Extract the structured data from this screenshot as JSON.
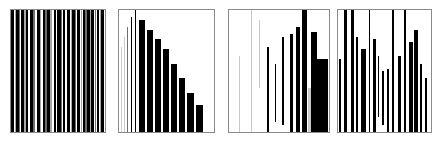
{
  "figure": {
    "title": "",
    "background_color": "#ffffff",
    "panel_border_color": "#8a8a8a",
    "bar_color": "#000000",
    "gray_bar_color": "#a8a8a8",
    "caption_text": "",
    "panel_count": 4
  },
  "chart_data": [
    {
      "type": "bar",
      "title": "Panel 1",
      "subtitle": "",
      "xlabel": "",
      "ylabel": "",
      "grid": false,
      "legend": "none",
      "orientation": "vertical",
      "description": "Dense full-height vertical bar code pattern spanning the full panel height",
      "xlim": [
        0,
        100
      ],
      "ylim": [
        0,
        100
      ],
      "categories": [
        "b1",
        "b2",
        "b3",
        "b4",
        "b5",
        "b6",
        "b7",
        "b8",
        "b9",
        "b10",
        "b11",
        "b12",
        "b13",
        "b14",
        "b15",
        "b16",
        "b17",
        "b18",
        "b19",
        "b20",
        "b21",
        "b22",
        "b23",
        "b24",
        "b25",
        "b26",
        "b27",
        "b28",
        "b29",
        "b30",
        "b31",
        "b32",
        "b33",
        "b34"
      ],
      "values": [
        100,
        100,
        100,
        100,
        100,
        100,
        100,
        100,
        100,
        100,
        100,
        100,
        100,
        100,
        100,
        100,
        100,
        100,
        100,
        100,
        100,
        100,
        100,
        100,
        100,
        100,
        100,
        100,
        100,
        100,
        100,
        100,
        100,
        100
      ],
      "bars": [
        {
          "x": 0.5,
          "w": 3.0,
          "y0": 0,
          "y1": 100,
          "shade": "black"
        },
        {
          "x": 4.0,
          "w": 1.5,
          "y0": 0,
          "y1": 100,
          "shade": "gray"
        },
        {
          "x": 5.8,
          "w": 2.6,
          "y0": 0,
          "y1": 100,
          "shade": "black"
        },
        {
          "x": 8.8,
          "w": 1.2,
          "y0": 0,
          "y1": 100,
          "shade": "midgray"
        },
        {
          "x": 10.4,
          "w": 3.4,
          "y0": 0,
          "y1": 100,
          "shade": "black"
        },
        {
          "x": 14.2,
          "w": 1.6,
          "y0": 0,
          "y1": 100,
          "shade": "gray"
        },
        {
          "x": 16.2,
          "w": 2.2,
          "y0": 0,
          "y1": 100,
          "shade": "black"
        },
        {
          "x": 20.6,
          "w": 2.8,
          "y0": 0,
          "y1": 100,
          "shade": "black"
        },
        {
          "x": 23.8,
          "w": 1.4,
          "y0": 0,
          "y1": 100,
          "shade": "midgray"
        },
        {
          "x": 27.4,
          "w": 3.2,
          "y0": 0,
          "y1": 100,
          "shade": "black"
        },
        {
          "x": 31.0,
          "w": 1.0,
          "y0": 0,
          "y1": 100,
          "shade": "gray"
        },
        {
          "x": 33.6,
          "w": 2.4,
          "y0": 0,
          "y1": 100,
          "shade": "black"
        },
        {
          "x": 36.4,
          "w": 1.8,
          "y0": 0,
          "y1": 100,
          "shade": "midgray"
        },
        {
          "x": 38.6,
          "w": 3.0,
          "y0": 0,
          "y1": 100,
          "shade": "black"
        },
        {
          "x": 42.0,
          "w": 1.2,
          "y0": 0,
          "y1": 100,
          "shade": "gray"
        },
        {
          "x": 45.4,
          "w": 2.0,
          "y0": 0,
          "y1": 100,
          "shade": "black"
        },
        {
          "x": 49.2,
          "w": 3.6,
          "y0": 0,
          "y1": 100,
          "shade": "black"
        },
        {
          "x": 53.2,
          "w": 1.4,
          "y0": 0,
          "y1": 100,
          "shade": "midgray"
        },
        {
          "x": 55.0,
          "w": 2.6,
          "y0": 0,
          "y1": 100,
          "shade": "black"
        },
        {
          "x": 59.6,
          "w": 3.4,
          "y0": 0,
          "y1": 100,
          "shade": "black"
        },
        {
          "x": 63.4,
          "w": 1.6,
          "y0": 0,
          "y1": 100,
          "shade": "gray"
        },
        {
          "x": 65.4,
          "w": 2.2,
          "y0": 0,
          "y1": 100,
          "shade": "black"
        },
        {
          "x": 68.0,
          "w": 1.2,
          "y0": 0,
          "y1": 100,
          "shade": "midgray"
        },
        {
          "x": 70.6,
          "w": 3.0,
          "y0": 0,
          "y1": 100,
          "shade": "black"
        },
        {
          "x": 74.0,
          "w": 1.8,
          "y0": 0,
          "y1": 100,
          "shade": "gray"
        },
        {
          "x": 76.2,
          "w": 2.4,
          "y0": 0,
          "y1": 100,
          "shade": "black"
        },
        {
          "x": 79.0,
          "w": 1.4,
          "y0": 0,
          "y1": 100,
          "shade": "midgray"
        },
        {
          "x": 80.8,
          "w": 2.8,
          "y0": 0,
          "y1": 100,
          "shade": "black"
        },
        {
          "x": 84.0,
          "w": 1.2,
          "y0": 0,
          "y1": 100,
          "shade": "gray"
        },
        {
          "x": 85.6,
          "w": 3.2,
          "y0": 0,
          "y1": 100,
          "shade": "black"
        },
        {
          "x": 89.2,
          "w": 1.6,
          "y0": 0,
          "y1": 100,
          "shade": "midgray"
        },
        {
          "x": 91.2,
          "w": 2.6,
          "y0": 0,
          "y1": 100,
          "shade": "black"
        },
        {
          "x": 94.2,
          "w": 1.4,
          "y0": 0,
          "y1": 100,
          "shade": "gray"
        },
        {
          "x": 96.0,
          "w": 3.4,
          "y0": 0,
          "y1": 100,
          "shade": "black"
        }
      ]
    },
    {
      "type": "bar",
      "title": "Panel 2",
      "subtitle": "",
      "xlabel": "",
      "ylabel": "",
      "grid": false,
      "legend": "none",
      "orientation": "vertical",
      "description": "Monotonically decreasing staircase of bars; leftmost bars are thin light-gray and tall, right bars are thick black and short",
      "xlim": [
        0,
        100
      ],
      "ylim": [
        0,
        100
      ],
      "categories": [
        "1",
        "2",
        "3",
        "4",
        "5",
        "6",
        "7",
        "8",
        "9",
        "10",
        "11",
        "12",
        "13"
      ],
      "values": [
        98,
        92,
        84,
        72,
        96,
        86,
        76,
        66,
        56,
        46,
        36,
        26,
        18
      ],
      "bars": [
        {
          "x": 2.0,
          "w": 0.9,
          "y0": 0,
          "y1": 70,
          "shade": "lightgray"
        },
        {
          "x": 5.0,
          "w": 0.9,
          "y0": 0,
          "y1": 78,
          "shade": "lightgray"
        },
        {
          "x": 8.5,
          "w": 1.1,
          "y0": 0,
          "y1": 86,
          "shade": "midgray"
        },
        {
          "x": 12.5,
          "w": 1.4,
          "y0": 0,
          "y1": 94,
          "shade": "black"
        },
        {
          "x": 16.5,
          "w": 1.6,
          "y0": 0,
          "y1": 100,
          "shade": "black"
        },
        {
          "x": 21.0,
          "w": 6.5,
          "y0": 0,
          "y1": 92,
          "shade": "black"
        },
        {
          "x": 29.5,
          "w": 6.5,
          "y0": 0,
          "y1": 84,
          "shade": "black"
        },
        {
          "x": 38.0,
          "w": 6.5,
          "y0": 0,
          "y1": 76,
          "shade": "black"
        },
        {
          "x": 46.5,
          "w": 6.5,
          "y0": 0,
          "y1": 68,
          "shade": "black"
        },
        {
          "x": 55.0,
          "w": 6.5,
          "y0": 0,
          "y1": 56,
          "shade": "black"
        },
        {
          "x": 63.5,
          "w": 6.5,
          "y0": 0,
          "y1": 44,
          "shade": "black"
        },
        {
          "x": 72.0,
          "w": 6.5,
          "y0": 0,
          "y1": 32,
          "shade": "black"
        },
        {
          "x": 81.0,
          "w": 7.0,
          "y0": 0,
          "y1": 22,
          "shade": "black"
        }
      ]
    },
    {
      "type": "bar",
      "title": "Panel 3",
      "subtitle": "",
      "xlabel": "",
      "ylabel": "",
      "grid": false,
      "legend": "none",
      "orientation": "vertical",
      "description": "Floating bars increasing in weight and width left to right; thin light-gray tall lines on the left, thick black bars on the right",
      "xlim": [
        0,
        100
      ],
      "ylim": [
        0,
        100
      ],
      "categories": [
        "1",
        "2",
        "3",
        "4",
        "5",
        "6",
        "7",
        "8",
        "9",
        "10",
        "11"
      ],
      "values": [
        62,
        100,
        56,
        100,
        70,
        48,
        66,
        80,
        100,
        82,
        60
      ],
      "bars": [
        {
          "x": 10.0,
          "w": 0.8,
          "y0": 0,
          "y1": 62,
          "shade": "lightgray"
        },
        {
          "x": 21.5,
          "w": 0.9,
          "y0": 0,
          "y1": 100,
          "shade": "lightgray"
        },
        {
          "x": 30.0,
          "w": 0.9,
          "y0": 36,
          "y1": 92,
          "shade": "lightgray"
        },
        {
          "x": 38.0,
          "w": 1.6,
          "y0": 0,
          "y1": 70,
          "shade": "black"
        },
        {
          "x": 45.5,
          "w": 1.8,
          "y0": 8,
          "y1": 56,
          "shade": "black"
        },
        {
          "x": 53.0,
          "w": 2.4,
          "y0": 6,
          "y1": 78,
          "shade": "black"
        },
        {
          "x": 60.5,
          "w": 3.0,
          "y0": 0,
          "y1": 80,
          "shade": "black"
        },
        {
          "x": 66.5,
          "w": 4.0,
          "y0": 0,
          "y1": 86,
          "shade": "black"
        },
        {
          "x": 72.5,
          "w": 5.5,
          "y0": 0,
          "y1": 100,
          "shade": "black"
        },
        {
          "x": 78.5,
          "w": 3.0,
          "y0": 0,
          "y1": 36,
          "shade": "lightgray"
        },
        {
          "x": 81.5,
          "w": 6.0,
          "y0": 0,
          "y1": 82,
          "shade": "black"
        },
        {
          "x": 88.0,
          "w": 11.0,
          "y0": 0,
          "y1": 60,
          "shade": "black"
        }
      ]
    },
    {
      "type": "bar",
      "title": "Panel 4",
      "subtitle": "",
      "xlabel": "",
      "ylabel": "",
      "grid": false,
      "legend": "none",
      "orientation": "vertical",
      "description": "Interleaved floating black bars of mixed widths with varying vertical start and end positions",
      "xlim": [
        0,
        100
      ],
      "ylim": [
        0,
        100
      ],
      "categories": [
        "1",
        "2",
        "3",
        "4",
        "5",
        "6",
        "7",
        "8",
        "9",
        "10",
        "11",
        "12",
        "13",
        "14",
        "15",
        "16"
      ],
      "values": [
        60,
        100,
        100,
        78,
        68,
        66,
        62,
        50,
        52,
        100,
        62,
        100,
        74,
        84,
        56,
        44
      ],
      "bars": [
        {
          "x": 1.5,
          "w": 2.2,
          "y0": 0,
          "y1": 60,
          "shade": "black"
        },
        {
          "x": 6.5,
          "w": 3.0,
          "y0": 0,
          "y1": 100,
          "shade": "black"
        },
        {
          "x": 14.0,
          "w": 3.0,
          "y0": 0,
          "y1": 100,
          "shade": "black"
        },
        {
          "x": 19.0,
          "w": 2.0,
          "y0": 0,
          "y1": 78,
          "shade": "black"
        },
        {
          "x": 25.0,
          "w": 5.5,
          "y0": 0,
          "y1": 68,
          "shade": "black"
        },
        {
          "x": 33.0,
          "w": 1.6,
          "y0": 0,
          "y1": 100,
          "shade": "black"
        },
        {
          "x": 38.0,
          "w": 3.0,
          "y0": 0,
          "y1": 76,
          "shade": "black"
        },
        {
          "x": 42.5,
          "w": 2.0,
          "y0": 12,
          "y1": 62,
          "shade": "black"
        },
        {
          "x": 47.5,
          "w": 1.8,
          "y0": 6,
          "y1": 50,
          "shade": "black"
        },
        {
          "x": 53.0,
          "w": 1.6,
          "y0": 0,
          "y1": 52,
          "shade": "black"
        },
        {
          "x": 58.5,
          "w": 1.4,
          "y0": 0,
          "y1": 100,
          "shade": "black"
        },
        {
          "x": 64.5,
          "w": 3.0,
          "y0": 0,
          "y1": 62,
          "shade": "black"
        },
        {
          "x": 71.0,
          "w": 2.2,
          "y0": 0,
          "y1": 100,
          "shade": "black"
        },
        {
          "x": 76.0,
          "w": 4.5,
          "y0": 0,
          "y1": 74,
          "shade": "black"
        },
        {
          "x": 82.0,
          "w": 3.5,
          "y0": 0,
          "y1": 84,
          "shade": "black"
        },
        {
          "x": 88.0,
          "w": 2.0,
          "y0": 0,
          "y1": 56,
          "shade": "black"
        },
        {
          "x": 93.5,
          "w": 2.2,
          "y0": 0,
          "y1": 44,
          "shade": "black"
        }
      ]
    }
  ],
  "panels": [
    {
      "name": "panel-1",
      "left": 10,
      "top": 9,
      "width": 96,
      "height": 124
    },
    {
      "name": "panel-2",
      "left": 118,
      "top": 9,
      "width": 97,
      "height": 124
    },
    {
      "name": "panel-3",
      "left": 228,
      "top": 9,
      "width": 102,
      "height": 124
    },
    {
      "name": "panel-4",
      "left": 337,
      "top": 9,
      "width": 95,
      "height": 124
    }
  ]
}
